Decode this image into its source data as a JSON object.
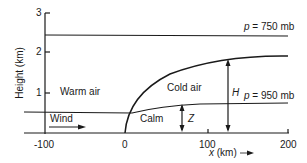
{
  "diagram": {
    "type": "cross-section",
    "y_axis": {
      "label": "Height (km)",
      "ticks": [
        "1",
        "2",
        "3"
      ]
    },
    "x_axis": {
      "label": "x (km)",
      "ticks": [
        "-100",
        "0",
        "100",
        "200"
      ]
    },
    "regions": {
      "warm_air": "Warm air",
      "cold_air": "Cold air",
      "calm": "Calm",
      "wind": "Wind"
    },
    "isobars": {
      "upper": "p = 750 mb",
      "lower": "p = 950 mb"
    },
    "dimensions": {
      "z": "Z",
      "h": "H"
    }
  }
}
